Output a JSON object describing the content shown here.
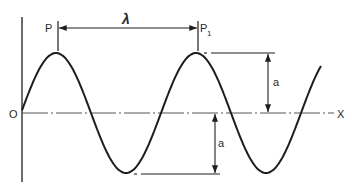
{
  "diagram": {
    "labels": {
      "origin": "O",
      "x_axis": "X",
      "point_p": "P",
      "point_p1": "P",
      "point_p1_sub": "1",
      "wavelength": "λ",
      "amplitude_upper": "a",
      "amplitude_lower": "a"
    },
    "colors": {
      "ink": "#1e1e1e",
      "axis": "#555555",
      "background": "#ffffff"
    },
    "wave": {
      "type": "sine",
      "origin_px": [
        22,
        113
      ],
      "wavelength_px": 140,
      "amplitude_px": 60,
      "end_x_px": 321
    }
  }
}
